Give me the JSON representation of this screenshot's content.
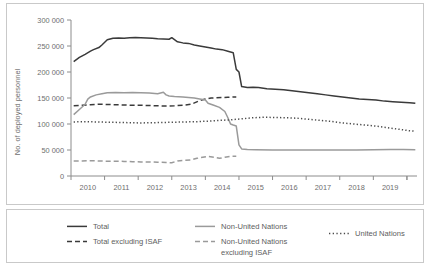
{
  "chart_data": {
    "type": "line",
    "title": "",
    "subtitle": "",
    "xlabel": "",
    "ylabel": "No. of deployed personnel",
    "xlim": [
      2009.5,
      2019.8
    ],
    "ylim": [
      0,
      300000
    ],
    "grid": false,
    "legend_position": "bottom",
    "y_ticks": [
      0,
      50000,
      100000,
      150000,
      200000,
      250000,
      300000
    ],
    "y_ticklabels": [
      "0",
      "50 000",
      "100 000",
      "150 000",
      "200 000",
      "250 000",
      "300 000"
    ],
    "x_ticks": [
      2010,
      2011,
      2012,
      2013,
      2014,
      2015,
      2016,
      2017,
      2018,
      2019
    ],
    "x_ticklabels": [
      "2010",
      "2011",
      "2012",
      "2013",
      "2014",
      "2015",
      "2016",
      "2017",
      "2018",
      "2019"
    ],
    "series": [
      {
        "name": "Total",
        "style": "solid",
        "color": "#3a3a3a",
        "width": 1.5,
        "x": [
          2009.58,
          2009.75,
          2009.92,
          2010.08,
          2010.17,
          2010.33,
          2010.42,
          2010.58,
          2010.75,
          2010.92,
          2011.08,
          2011.25,
          2011.42,
          2011.58,
          2011.75,
          2011.92,
          2012.08,
          2012.25,
          2012.42,
          2012.5,
          2012.67,
          2012.83,
          2013.0,
          2013.17,
          2013.33,
          2013.5,
          2013.67,
          2013.83,
          2014.0,
          2014.17,
          2014.33,
          2014.42,
          2014.5,
          2014.58,
          2014.75,
          2014.92,
          2015.08,
          2015.33,
          2015.58,
          2015.83,
          2016.08,
          2016.33,
          2016.58,
          2016.83,
          2017.08,
          2017.33,
          2017.58,
          2017.83,
          2018.08,
          2018.33,
          2018.58,
          2018.83,
          2019.08,
          2019.33,
          2019.58,
          2019.75
        ],
        "y": [
          220000,
          228000,
          234000,
          240000,
          243000,
          247000,
          252000,
          262000,
          265000,
          265500,
          265000,
          266000,
          266500,
          266000,
          265500,
          265000,
          264000,
          263500,
          263000,
          266000,
          258000,
          256000,
          255000,
          252000,
          250000,
          248000,
          246000,
          244000,
          243000,
          240000,
          237000,
          205000,
          200000,
          172000,
          170000,
          170500,
          170000,
          168000,
          167000,
          166000,
          164000,
          162000,
          160000,
          158000,
          156000,
          154000,
          152000,
          150000,
          148000,
          147000,
          146000,
          144000,
          143000,
          142000,
          141000,
          140000
        ]
      },
      {
        "name": "Total excluding ISAF",
        "style": "dashed",
        "color": "#3a3a3a",
        "width": 1.5,
        "x": [
          2009.58,
          2009.83,
          2010.08,
          2010.33,
          2010.58,
          2010.83,
          2011.08,
          2011.33,
          2011.58,
          2011.83,
          2012.08,
          2012.33,
          2012.58,
          2012.83,
          2013.08,
          2013.33,
          2013.5,
          2013.67,
          2013.83,
          2014.0,
          2014.17,
          2014.33,
          2014.42
        ],
        "y": [
          135000,
          136000,
          137000,
          138000,
          137500,
          137000,
          136500,
          136000,
          136000,
          135500,
          135000,
          134500,
          135000,
          136000,
          138000,
          145000,
          148000,
          150000,
          150500,
          151000,
          151500,
          152000,
          152000
        ]
      },
      {
        "name": "Non-United Nations",
        "style": "solid",
        "color": "#9a9a9a",
        "width": 1.5,
        "x": [
          2009.58,
          2009.75,
          2009.92,
          2010.0,
          2010.08,
          2010.25,
          2010.42,
          2010.58,
          2010.83,
          2011.08,
          2011.33,
          2011.58,
          2011.83,
          2012.08,
          2012.25,
          2012.33,
          2012.42,
          2012.58,
          2012.83,
          2013.0,
          2013.17,
          2013.33,
          2013.5,
          2013.58,
          2013.75,
          2013.92,
          2014.08,
          2014.17,
          2014.25,
          2014.33,
          2014.42,
          2014.5,
          2014.58,
          2014.75,
          2015.0,
          2015.5,
          2016.0,
          2016.5,
          2017.0,
          2017.5,
          2018.0,
          2018.5,
          2019.0,
          2019.4,
          2019.75
        ],
        "y": [
          118000,
          128000,
          138000,
          148000,
          152000,
          156000,
          158000,
          160000,
          160500,
          160000,
          160500,
          160000,
          159500,
          158000,
          161000,
          156000,
          154000,
          153000,
          152000,
          151000,
          150000,
          148000,
          146000,
          140000,
          136000,
          132000,
          124000,
          112000,
          100000,
          98000,
          96000,
          60000,
          52000,
          51000,
          50500,
          50000,
          50000,
          50000,
          50000,
          50000,
          50000,
          50500,
          51000,
          51000,
          50500
        ]
      },
      {
        "name": "Non-United Nations excluding ISAF",
        "style": "dashed",
        "color": "#9a9a9a",
        "width": 1.5,
        "x": [
          2009.58,
          2009.83,
          2010.08,
          2010.33,
          2010.58,
          2010.83,
          2011.08,
          2011.33,
          2011.58,
          2011.83,
          2012.08,
          2012.33,
          2012.5,
          2012.67,
          2012.83,
          2013.08,
          2013.25,
          2013.42,
          2013.58,
          2013.75,
          2013.92,
          2014.08,
          2014.25,
          2014.42
        ],
        "y": [
          29000,
          29000,
          29500,
          29000,
          28500,
          28500,
          28000,
          27500,
          27000,
          27000,
          26500,
          26000,
          25500,
          29000,
          30000,
          31000,
          34000,
          36000,
          38000,
          36000,
          34000,
          36000,
          38000,
          38000
        ]
      },
      {
        "name": "United Nations",
        "style": "dotted",
        "color": "#4a4a4a",
        "width": 1.5,
        "x": [
          2009.58,
          2009.92,
          2010.25,
          2010.58,
          2010.92,
          2011.25,
          2011.58,
          2011.92,
          2012.25,
          2012.58,
          2012.92,
          2013.25,
          2013.58,
          2013.92,
          2014.25,
          2014.58,
          2014.92,
          2015.25,
          2015.58,
          2015.92,
          2016.25,
          2016.58,
          2016.92,
          2017.25,
          2017.58,
          2017.92,
          2018.25,
          2018.58,
          2018.92,
          2019.25,
          2019.58,
          2019.75
        ],
        "y": [
          104000,
          104500,
          104000,
          103500,
          103000,
          102500,
          102000,
          102500,
          103000,
          103500,
          104000,
          104500,
          105500,
          107000,
          108000,
          110000,
          112000,
          113000,
          112500,
          112000,
          111000,
          109000,
          107000,
          105000,
          102000,
          100000,
          98000,
          96000,
          93000,
          90000,
          87000,
          86000
        ]
      }
    ]
  },
  "legend": {
    "items": [
      {
        "label": "Total",
        "style": "solid",
        "color": "#3a3a3a"
      },
      {
        "label": "Total excluding ISAF",
        "style": "dashed",
        "color": "#3a3a3a"
      },
      {
        "label": "Non-United Nations",
        "style": "solid",
        "color": "#9a9a9a"
      },
      {
        "label": "Non-United Nations",
        "label2": "excluding ISAF",
        "style": "dashed",
        "color": "#9a9a9a"
      },
      {
        "label": "United Nations",
        "style": "dotted",
        "color": "#4a4a4a"
      }
    ]
  }
}
